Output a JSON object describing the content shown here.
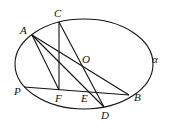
{
  "diagram": {
    "type": "geometry",
    "curve_label": "α",
    "points": [
      {
        "id": "A",
        "label": "A"
      },
      {
        "id": "C",
        "label": "C"
      },
      {
        "id": "O",
        "label": "O"
      },
      {
        "id": "B",
        "label": "B"
      },
      {
        "id": "P",
        "label": "P"
      },
      {
        "id": "F",
        "label": "F"
      },
      {
        "id": "E",
        "label": "E"
      },
      {
        "id": "D",
        "label": "D"
      }
    ],
    "segments": [
      [
        "A",
        "B"
      ],
      [
        "C",
        "D"
      ],
      [
        "C",
        "F"
      ],
      [
        "A",
        "F"
      ],
      [
        "A",
        "D"
      ],
      [
        "P",
        "B"
      ]
    ]
  }
}
